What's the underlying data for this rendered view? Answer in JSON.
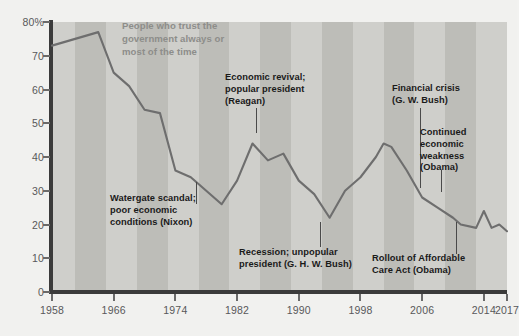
{
  "chart_data": {
    "type": "line",
    "title": "People who trust the\ngovernment always or\nmost of the time",
    "xlabel": "",
    "ylabel": "",
    "xlim": [
      1958,
      2017
    ],
    "ylim": [
      0,
      80
    ],
    "grid": false,
    "legend_position": "none",
    "y_tick_labels": [
      "80%",
      "70",
      "60",
      "50",
      "40",
      "30",
      "20",
      "10",
      "0"
    ],
    "y_ticks": [
      80,
      70,
      60,
      50,
      40,
      30,
      20,
      10,
      0
    ],
    "x_tick_labels": [
      "1958",
      "1966",
      "1974",
      "1982",
      "1990",
      "1998",
      "2006",
      "2014",
      "2017"
    ],
    "x_ticks": [
      1958,
      1966,
      1974,
      1982,
      1990,
      1998,
      2006,
      2014,
      2017
    ],
    "series": [
      {
        "name": "People who trust the government always or most of the time",
        "color": "#6e6e6e",
        "x": [
          1958,
          1964,
          1966,
          1968,
          1970,
          1972,
          1974,
          1976,
          1978,
          1980,
          1982,
          1984,
          1986,
          1988,
          1990,
          1992,
          1994,
          1996,
          1998,
          2000,
          2001,
          2002,
          2004,
          2006,
          2008,
          2010,
          2011,
          2013,
          2014,
          2015,
          2016,
          2017
        ],
        "values": [
          73,
          77,
          65,
          61,
          54,
          53,
          36,
          34,
          30,
          26,
          33,
          44,
          39,
          41,
          33,
          29,
          22,
          30,
          34,
          40,
          44,
          43,
          36,
          28,
          25,
          22,
          20,
          19,
          24,
          19,
          20,
          18
        ]
      }
    ],
    "annotations": [
      {
        "id": "watergate",
        "text": "Watergate scandal;\npoor economic\nconditions (Nixon)",
        "target_year": 1976,
        "target_value": 34
      },
      {
        "id": "reagan",
        "text": "Economic revival;\npopular president\n(Reagan)",
        "target_year": 1984,
        "target_value": 44
      },
      {
        "id": "bush-recession",
        "text": "Recession; unpopular\npresident (G. H. W. Bush)",
        "target_year": 1994,
        "target_value": 22
      },
      {
        "id": "financial-crisis",
        "text": "Financial crisis\n(G. W. Bush)",
        "target_year": 2008,
        "target_value": 25
      },
      {
        "id": "continued-weakness",
        "text": "Continued\neconomic\nweakness\n(Obama)",
        "target_year": 2010,
        "target_value": 22
      },
      {
        "id": "aca-rollout",
        "text": "Rollout of Affordable\nCare Act (Obama)",
        "target_year": 2013,
        "target_value": 19
      }
    ],
    "colors": {
      "line": "#6e6e6e",
      "plot_background": "#cfcfcb",
      "band_alternate": "#bdbdb8",
      "axis": "#3b3b3b",
      "tick_label": "#58585a",
      "annotation_text": "#1a1a1a",
      "title_text": "#8d8d8a",
      "page_background": "#f1f1ef"
    }
  }
}
